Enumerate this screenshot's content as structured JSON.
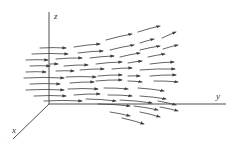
{
  "figure": {
    "type": "3d-vector-field",
    "axes": {
      "origin": [
        49,
        104
      ],
      "z": {
        "label": "z",
        "end": [
          49,
          12
        ],
        "label_pos": [
          54,
          19
        ]
      },
      "y": {
        "label": "y",
        "end": [
          226,
          104
        ],
        "label_pos": [
          216,
          99
        ]
      },
      "x": {
        "label": "x",
        "end": [
          13,
          139
        ],
        "label_pos": [
          12,
          133
        ]
      }
    },
    "colors": {
      "ink": "#3c3c3c",
      "background": "#ffffff"
    },
    "arrows": [
      [
        [
          40,
          48
        ],
        [
          66,
          48
        ]
      ],
      [
        [
          74,
          47
        ],
        [
          100,
          44
        ]
      ],
      [
        [
          106,
          40
        ],
        [
          132,
          34
        ]
      ],
      [
        [
          138,
          32
        ],
        [
          160,
          26
        ]
      ],
      [
        [
          140,
          43
        ],
        [
          154,
          39
        ]
      ],
      [
        [
          162,
          38
        ],
        [
          176,
          32
        ]
      ],
      [
        [
          32,
          54
        ],
        [
          68,
          54
        ]
      ],
      [
        [
          78,
          53
        ],
        [
          103,
          51
        ]
      ],
      [
        [
          110,
          50
        ],
        [
          134,
          45
        ]
      ],
      [
        [
          140,
          50
        ],
        [
          160,
          46
        ]
      ],
      [
        [
          163,
          49
        ],
        [
          178,
          45
        ]
      ],
      [
        [
          26,
          60
        ],
        [
          48,
          60
        ]
      ],
      [
        [
          56,
          59
        ],
        [
          82,
          58
        ]
      ],
      [
        [
          90,
          58
        ],
        [
          114,
          56
        ]
      ],
      [
        [
          120,
          57
        ],
        [
          140,
          53
        ]
      ],
      [
        [
          148,
          57
        ],
        [
          165,
          54
        ]
      ],
      [
        [
          30,
          66
        ],
        [
          50,
          66
        ]
      ],
      [
        [
          50,
          64
        ],
        [
          58,
          64
        ]
      ],
      [
        [
          64,
          66
        ],
        [
          88,
          65
        ]
      ],
      [
        [
          96,
          64
        ],
        [
          122,
          62
        ]
      ],
      [
        [
          128,
          63
        ],
        [
          142,
          61
        ]
      ],
      [
        [
          150,
          64
        ],
        [
          174,
          62
        ]
      ],
      [
        [
          26,
          72
        ],
        [
          46,
          72
        ]
      ],
      [
        [
          56,
          71
        ],
        [
          74,
          71
        ]
      ],
      [
        [
          80,
          70
        ],
        [
          104,
          69
        ]
      ],
      [
        [
          112,
          69
        ],
        [
          132,
          68
        ]
      ],
      [
        [
          140,
          70
        ],
        [
          175,
          69
        ]
      ],
      [
        [
          24,
          78
        ],
        [
          64,
          78
        ]
      ],
      [
        [
          66,
          77
        ],
        [
          96,
          77
        ]
      ],
      [
        [
          98,
          76
        ],
        [
          122,
          75
        ]
      ],
      [
        [
          128,
          76
        ],
        [
          140,
          76
        ]
      ],
      [
        [
          150,
          76
        ],
        [
          176,
          75
        ]
      ],
      [
        [
          30,
          84
        ],
        [
          60,
          84
        ]
      ],
      [
        [
          70,
          83
        ],
        [
          94,
          82
        ]
      ],
      [
        [
          96,
          81
        ],
        [
          122,
          80
        ]
      ],
      [
        [
          128,
          81
        ],
        [
          142,
          82
        ]
      ],
      [
        [
          154,
          81
        ],
        [
          178,
          82
        ]
      ],
      [
        [
          26,
          90
        ],
        [
          64,
          90
        ]
      ],
      [
        [
          68,
          89
        ],
        [
          98,
          89
        ]
      ],
      [
        [
          104,
          88
        ],
        [
          128,
          89
        ]
      ],
      [
        [
          138,
          88
        ],
        [
          164,
          91
        ]
      ],
      [
        [
          34,
          96
        ],
        [
          66,
          96
        ]
      ],
      [
        [
          74,
          95
        ],
        [
          100,
          94
        ]
      ],
      [
        [
          108,
          95
        ],
        [
          132,
          96
        ]
      ],
      [
        [
          140,
          96
        ],
        [
          166,
          99
        ]
      ],
      [
        [
          44,
          101
        ],
        [
          82,
          101
        ]
      ],
      [
        [
          86,
          99
        ],
        [
          116,
          101
        ]
      ],
      [
        [
          120,
          100
        ],
        [
          152,
          103
        ]
      ],
      [
        [
          158,
          101
        ],
        [
          176,
          105
        ]
      ],
      [
        [
          98,
          104
        ],
        [
          130,
          106
        ]
      ],
      [
        [
          134,
          106
        ],
        [
          158,
          110
        ]
      ],
      [
        [
          160,
          107
        ],
        [
          178,
          111
        ]
      ],
      [
        [
          110,
          112
        ],
        [
          130,
          116
        ]
      ],
      [
        [
          140,
          112
        ],
        [
          160,
          117
        ]
      ],
      [
        [
          122,
          118
        ],
        [
          144,
          124
        ]
      ]
    ]
  }
}
